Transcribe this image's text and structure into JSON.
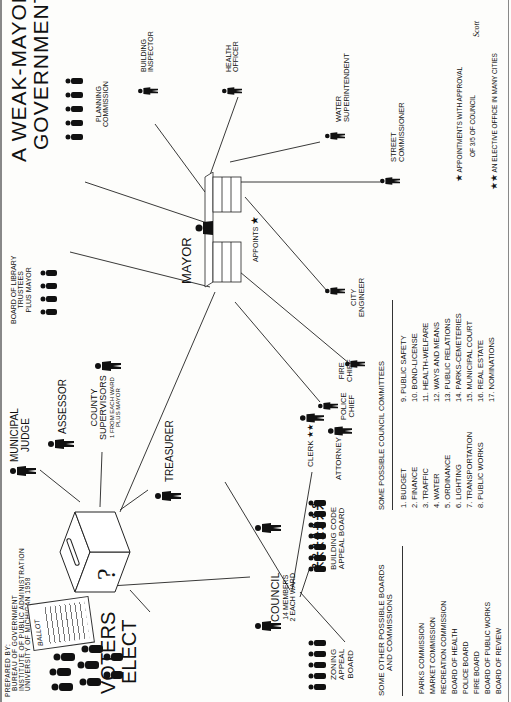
{
  "title": {
    "line1": "A WEAK-MAYOR",
    "line2": "GOVERNMENT"
  },
  "credit": {
    "line1": "PREPARED BY:",
    "line2": "BUREAU OF GOVERNMENT",
    "line3": "INSTITUTE OF PUBLIC ADMINISTRATION",
    "line4": "UNIVERSITY OF MICHIGAN 1958"
  },
  "voters": {
    "line1": "VOTERS",
    "line2": "ELECT",
    "ballot_label": "BALLOT"
  },
  "elected": {
    "municipal_judge": {
      "line1": "MUNICIPAL",
      "line2": "JUDGE"
    },
    "assessor": "ASSESSOR",
    "county_supervisors": {
      "line1": "COUNTY",
      "line2": "SUPERVISORS",
      "line3": "1 FROM EACH WARD",
      "line4": "PLUS MAYOR"
    },
    "treasurer": "TREASURER",
    "council": {
      "line1": "COUNCIL",
      "line2": "14 MEMBERS",
      "line3": "2 EACH WARD"
    },
    "mayor": "MAYOR"
  },
  "council_appoints": {
    "clerk": "CLERK",
    "clerk_mark": "★★",
    "attorney": "ATTORNEY",
    "building_code": {
      "line1": "BUILDING CODE",
      "line2": "APPEAL BOARD"
    },
    "zoning": {
      "line1": "ZONING",
      "line2": "APPEAL",
      "line3": "BOARD"
    }
  },
  "mayor_appoints": {
    "appoints_label": "APPOINTS",
    "appoints_mark": "★",
    "library": {
      "line1": "BOARD OF LIBRARY",
      "line2": "TRUSTEES",
      "line3": "PLUS MAYOR"
    },
    "planning": {
      "line1": "PLANNING",
      "line2": "COMMISSION"
    },
    "building_inspector": {
      "line1": "BUILDING",
      "line2": "INSPECTOR"
    },
    "health_officer": {
      "line1": "HEALTH",
      "line2": "OFFICER"
    },
    "water": {
      "line1": "WATER",
      "line2": "SUPERINTENDENT"
    },
    "street": {
      "line1": "STREET",
      "line2": "COMMISSIONER"
    },
    "city_engineer": {
      "line1": "CITY",
      "line2": "ENGINEER"
    },
    "fire_chief": {
      "line1": "FIRE",
      "line2": "CHIEF"
    },
    "police_chief": {
      "line1": "POLICE",
      "line2": "CHIEF"
    }
  },
  "boards": {
    "heading1": "SOME OTHER POSSIBLE BOARDS",
    "heading2": "AND COMMISSIONS",
    "items": [
      "PARKS COMMISSION",
      "MARKET COMMISSION",
      "RECREATION COMMISSION",
      "BOARD OF HEALTH",
      "POLICE BOARD",
      "FIRE BOARD",
      "BOARD OF PUBLIC WORKS",
      "BOARD OF REVIEW"
    ]
  },
  "committees": {
    "heading": "SOME POSSIBLE COUNCIL COMMITTEES",
    "col1": [
      "1. BUDGET",
      "2. FINANCE",
      "3. TRAFFIC",
      "4. WATER",
      "5. ORDINANCE",
      "6. LIGHTING",
      "7. TRANSPORTATION",
      "8. PUBLIC WORKS"
    ],
    "col2": [
      "9. PUBLIC SAFETY",
      "10. BOND-LICENSE",
      "11. HEALTH-WELFARE",
      "12. WAYS AND MEANS",
      "13. PUBLIC RELATIONS",
      "14. PARKS-CEMETERIES",
      "15. MUNICIPAL COURT",
      "16. REAL ESTATE",
      "17. NOMINATIONS"
    ]
  },
  "legend": {
    "star1": "★",
    "star1_text1": "APPOINTMENTS WITH APPROVAL",
    "star1_text2": "OF 3/5 OF COUNCIL",
    "star2": "★★",
    "star2_text": "AN ELECTIVE OFFICE IN MANY CITIES",
    "signature": "Scott"
  }
}
